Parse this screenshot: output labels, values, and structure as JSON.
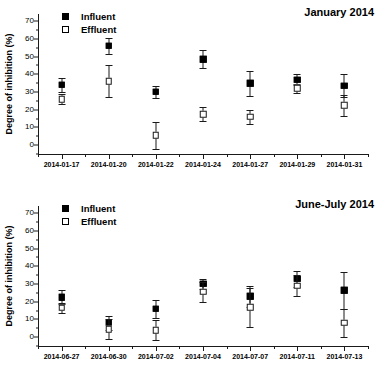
{
  "chart_data": [
    {
      "type": "scatter",
      "title": "January 2014",
      "xlabel": "",
      "ylabel": "Degree of inhibition (%)",
      "ylim": [
        -5,
        74
      ],
      "yticks": [
        0,
        10,
        20,
        30,
        40,
        50,
        60,
        70
      ],
      "grid": false,
      "legend": [
        "Influent",
        "Effluent"
      ],
      "legend_position": "top-left",
      "categories": [
        "2014-01-17",
        "2014-01-20",
        "2014-01-22",
        "2014-01-24",
        "2014-01-27",
        "2014-01-29",
        "2014-01-31"
      ],
      "series": [
        {
          "name": "Influent",
          "marker": "filled-square",
          "values": [
            34.0,
            56.0,
            30.0,
            48.5,
            35.0,
            37.0,
            33.5
          ],
          "errors": [
            4.0,
            4.5,
            3.5,
            5.0,
            7.0,
            3.0,
            6.5
          ]
        },
        {
          "name": "Effluent",
          "marker": "open-square",
          "values": [
            26.0,
            36.0,
            5.5,
            17.5,
            16.0,
            32.0,
            22.5
          ],
          "errors": [
            3.0,
            9.0,
            7.5,
            4.0,
            4.0,
            2.5,
            6.0
          ]
        }
      ]
    },
    {
      "type": "scatter",
      "title": "June-July 2014",
      "xlabel": "",
      "ylabel": "Degree of inhibition (%)",
      "ylim": [
        -5,
        74
      ],
      "yticks": [
        0,
        10,
        20,
        30,
        40,
        50,
        60,
        70
      ],
      "grid": false,
      "legend": [
        "Influent",
        "Effluent"
      ],
      "legend_position": "top-left",
      "categories": [
        "2014-06-27",
        "2014-06-30",
        "2014-07-02",
        "2014-07-04",
        "2014-07-07",
        "2014-07-11",
        "2014-07-13"
      ],
      "series": [
        {
          "name": "Influent",
          "marker": "filled-square",
          "values": [
            22.5,
            8.0,
            16.0,
            30.0,
            23.0,
            33.0,
            26.5
          ],
          "errors": [
            4.0,
            4.0,
            5.0,
            3.0,
            6.0,
            4.5,
            10.5
          ]
        },
        {
          "name": "Effluent",
          "marker": "open-square",
          "values": [
            16.5,
            4.5,
            4.0,
            25.5,
            17.0,
            29.0,
            8.0
          ],
          "errors": [
            3.0,
            5.5,
            5.5,
            5.5,
            11.0,
            6.0,
            8.0
          ]
        }
      ]
    }
  ]
}
